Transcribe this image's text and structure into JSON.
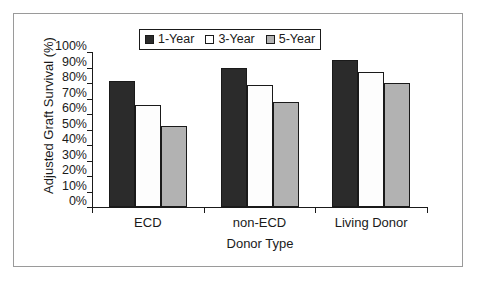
{
  "chart_data": {
    "type": "bar",
    "title": "",
    "xlabel": "Donor Type",
    "ylabel": "Adjusted Graft Survival (%)",
    "categories": [
      "ECD",
      "non-ECD",
      "Living Donor"
    ],
    "series": [
      {
        "name": "1-Year",
        "values": [
          81,
          90,
          95
        ],
        "color": "#2b2b2b"
      },
      {
        "name": "3-Year",
        "values": [
          66,
          79,
          87
        ],
        "color": "#ffffff"
      },
      {
        "name": "5-Year",
        "values": [
          52,
          68,
          80
        ],
        "color": "#b2b2b2"
      }
    ],
    "ylim": [
      0,
      100
    ],
    "ytick_labels": [
      "100%",
      "90%",
      "80%",
      "70%",
      "60%",
      "50%",
      "40%",
      "30%",
      "20%",
      "10%",
      "0%"
    ],
    "ytick_values": [
      100,
      90,
      80,
      70,
      60,
      50,
      40,
      30,
      20,
      10,
      0
    ],
    "grid": false,
    "legend_position": "top-center",
    "value_suffix": "%"
  },
  "legend": {
    "items": [
      {
        "label": "1-Year"
      },
      {
        "label": "3-Year"
      },
      {
        "label": "5-Year"
      }
    ]
  },
  "axes": {
    "y_title": "Adjusted Graft Survival (%)",
    "x_title": "Donor Type"
  }
}
